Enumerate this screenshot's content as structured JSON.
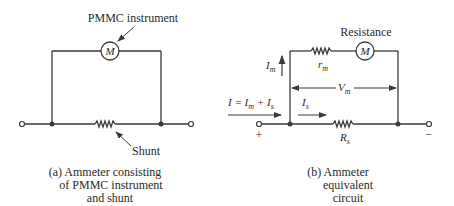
{
  "diagram_a": {
    "meter_symbol": "M",
    "meter_label": "PMMC instrument",
    "shunt_label": "Shunt",
    "caption": [
      "(a) Ammeter consisting",
      "of PMMC instrument",
      "and shunt"
    ]
  },
  "diagram_b": {
    "meter_symbol": "M",
    "resistance_label": "Resistance",
    "rm_label": "r",
    "rm_sub": "m",
    "im_label": "I",
    "im_sub": "m",
    "vm_label": "V",
    "vm_sub": "m",
    "is_label": "I",
    "is_sub": "s",
    "rs_label": "R",
    "rs_sub": "s",
    "total_current": "I = I",
    "total_current_mid": "m",
    "total_current_tail": " + I",
    "total_current_sub": "s",
    "plus": "+",
    "minus": "−",
    "caption": [
      "(b) Ammeter",
      "equivalent",
      "circuit"
    ]
  },
  "colors": {
    "line": "#3a3a3a",
    "text": "#2a2a2a"
  }
}
